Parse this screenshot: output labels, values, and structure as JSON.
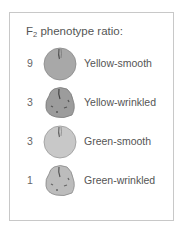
{
  "title": {
    "prefix": "F",
    "subscript": "2",
    "text": " phenotype ratio:"
  },
  "rows": [
    {
      "ratio": "9",
      "label": "Yellow-smooth",
      "shape": "smooth",
      "color": "#a9a9a9"
    },
    {
      "ratio": "3",
      "label": "Yellow-wrinkled",
      "shape": "wrinkled",
      "color": "#9c9c9c"
    },
    {
      "ratio": "3",
      "label": "Green-smooth",
      "shape": "smooth",
      "color": "#c9c9c9"
    },
    {
      "ratio": "1",
      "label": "Green-wrinkled",
      "shape": "wrinkled",
      "color": "#bdbdbd"
    }
  ]
}
